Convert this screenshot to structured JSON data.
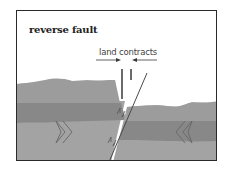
{
  "diagram": {
    "title": "reverse fault",
    "annotation": "land contracts",
    "icons": {
      "compression_left": "double-chevron-right-icon",
      "compression_right": "double-chevron-left-icon",
      "slip_arrows": "fault-slip-arrows-icon",
      "contract_arrows": "inward-arrows-icon"
    },
    "colors": {
      "frame": "#2a2a2a",
      "background": "#ffffff",
      "upper_layer": "#9c9c9c",
      "middle_layer": "#888888",
      "lower_layer": "#a3a3a3",
      "lines": "#4a4a4a"
    }
  }
}
